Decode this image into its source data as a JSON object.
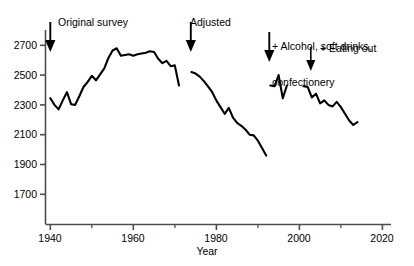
{
  "chart_data": {
    "type": "line",
    "title": "",
    "xlabel": "Year",
    "ylabel": "",
    "xlim": [
      1938,
      2021
    ],
    "ylim": [
      1620,
      2760
    ],
    "grid": false,
    "legend_position": "none",
    "yticks": [
      1700,
      1900,
      2100,
      2300,
      2500,
      2700
    ],
    "xticks": [
      1940,
      1960,
      1980,
      2000,
      2020
    ],
    "xminorticks": [
      1950,
      1970,
      1990,
      2010
    ],
    "annotations": [
      {
        "label": "Original survey",
        "year": 1940,
        "arrow": true
      },
      {
        "label": "Adjusted",
        "year": 1973,
        "arrow": true
      },
      {
        "label": "+ Alcohol, soft drinks,\nconfectionery",
        "year": 1993,
        "arrow": true
      },
      {
        "label": "+ Eating out",
        "year": 2001,
        "arrow": true
      }
    ],
    "series": [
      {
        "name": "Original survey",
        "x": [
          1940,
          1941,
          1942,
          1943,
          1944,
          1945,
          1946,
          1947,
          1948,
          1949,
          1950,
          1951,
          1952,
          1953,
          1954,
          1955,
          1956,
          1957,
          1958,
          1959,
          1960,
          1961,
          1962,
          1963,
          1964,
          1965,
          1966,
          1967,
          1968,
          1969,
          1970,
          1971
        ],
        "values": [
          2345,
          2300,
          2270,
          2330,
          2385,
          2305,
          2300,
          2360,
          2420,
          2455,
          2495,
          2465,
          2505,
          2545,
          2615,
          2665,
          2680,
          2630,
          2635,
          2640,
          2630,
          2640,
          2645,
          2650,
          2660,
          2655,
          2610,
          2580,
          2595,
          2560,
          2565,
          2430
        ]
      },
      {
        "name": "Adjusted",
        "x": [
          1974,
          1975,
          1976,
          1977,
          1978,
          1979,
          1980,
          1981,
          1982,
          1983,
          1984,
          1985,
          1986,
          1987,
          1988,
          1989,
          1990,
          1991,
          1992
        ],
        "values": [
          2520,
          2510,
          2490,
          2460,
          2425,
          2385,
          2330,
          2285,
          2240,
          2280,
          2215,
          2180,
          2160,
          2135,
          2100,
          2095,
          2060,
          2010,
          1960
        ]
      },
      {
        "name": "+ Alcohol, soft drinks, confectionery",
        "x": [
          1993,
          1994,
          1995,
          1996,
          1997
        ],
        "values": [
          2430,
          2425,
          2500,
          2345,
          2430
        ]
      },
      {
        "name": "+ Eating out",
        "x": [
          2001,
          2002,
          2003,
          2004,
          2005,
          2006,
          2007,
          2008,
          2009,
          2010,
          2011,
          2012,
          2013,
          2014
        ],
        "values": [
          2425,
          2420,
          2350,
          2375,
          2310,
          2330,
          2300,
          2290,
          2320,
          2285,
          2240,
          2195,
          2165,
          2185
        ]
      }
    ]
  },
  "axis": {
    "x_title": "Year",
    "y_tick_labels": [
      "2700",
      "2500",
      "2300",
      "2100",
      "1900",
      "1700"
    ],
    "x_tick_labels": [
      "1940",
      "1960",
      "1980",
      "2000",
      "2020"
    ]
  },
  "annotations": {
    "original_survey": "Original survey",
    "adjusted": "Adjusted",
    "alcohol_line1": "+ Alcohol, soft drinks,",
    "alcohol_line2": "confectionery",
    "eating_out": "+ Eating out"
  },
  "colors": {
    "line": "#000000",
    "axis": "#4d4d4d",
    "text": "#000000",
    "background": "#ffffff"
  }
}
